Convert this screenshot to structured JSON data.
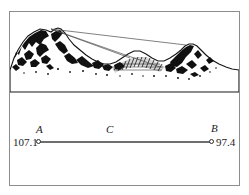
{
  "figure": {
    "name": "mountain-profile-and-baseline-diagram",
    "panels": {
      "top": {
        "name": "mountain-profile-panel",
        "description": "engraved mountain ridge profile with sight lines"
      },
      "bottom": {
        "name": "baseline-panel",
        "description": "horizontal baseline between two stations"
      }
    }
  },
  "baseline": {
    "point_a": {
      "label": "A",
      "value": "107.1"
    },
    "point_b": {
      "label": "B",
      "value": "97.4"
    },
    "segment": {
      "label": "C"
    }
  },
  "colors": {
    "frame": "#8d8d8d",
    "baseline": "#6e6e6e",
    "ink": "#1b1b1b",
    "paper": "#ffffff",
    "sightline": "#4a4a4a"
  }
}
